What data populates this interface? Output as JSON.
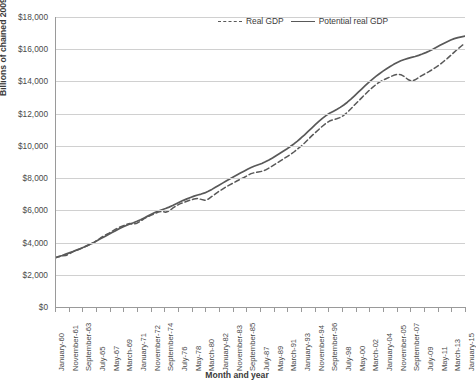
{
  "chart_data": {
    "type": "line",
    "title": "",
    "xlabel": "Month and year",
    "ylabel": "Billions of chained 2009 dollars",
    "ylim": [
      0,
      18000
    ],
    "ytick_labels": [
      "$18,000",
      "$16,000",
      "$14,000",
      "$12,000",
      "$10,000",
      "$8,000",
      "$6,000",
      "$4,000",
      "$2,000",
      "$0"
    ],
    "ytick_values": [
      18000,
      16000,
      14000,
      12000,
      10000,
      8000,
      6000,
      4000,
      2000,
      0
    ],
    "grid": true,
    "legend_position": "top-center",
    "x_tick_labels": [
      "January-60",
      "November-61",
      "September-63",
      "July-65",
      "May-67",
      "March-69",
      "January-71",
      "November-72",
      "September-74",
      "July-76",
      "May-78",
      "March-80",
      "January-82",
      "November-83",
      "September-85",
      "July-87",
      "May-89",
      "March-91",
      "January-93",
      "November-94",
      "September-96",
      "July-98",
      "May-00",
      "March-02",
      "January-04",
      "November-05",
      "September-07",
      "July-09",
      "May-11",
      "March-13",
      "January-15"
    ],
    "series": [
      {
        "name": "Real GDP",
        "style": "dashed",
        "color": "#595959",
        "values": [
          3050,
          3120,
          3180,
          3190,
          3300,
          3420,
          3520,
          3600,
          3690,
          3800,
          3900,
          4010,
          4160,
          4320,
          4450,
          4560,
          4700,
          4830,
          4940,
          5030,
          5120,
          5180,
          5140,
          5200,
          5330,
          5480,
          5600,
          5700,
          5800,
          5890,
          5940,
          5880,
          5960,
          6130,
          6280,
          6400,
          6480,
          6560,
          6640,
          6700,
          6740,
          6680,
          6620,
          6700,
          6860,
          7020,
          7180,
          7320,
          7460,
          7580,
          7700,
          7820,
          7930,
          8040,
          8160,
          8280,
          8340,
          8380,
          8420,
          8500,
          8620,
          8760,
          8900,
          9040,
          9180,
          9320,
          9460,
          9620,
          9800,
          9980,
          10180,
          10400,
          10620,
          10820,
          11020,
          11220,
          11400,
          11540,
          11620,
          11680,
          11760,
          11900,
          12080,
          12300,
          12540,
          12760,
          12980,
          13200,
          13420,
          13620,
          13800,
          13960,
          14080,
          14180,
          14280,
          14380,
          14440,
          14420,
          14300,
          14120,
          14020,
          14100,
          14240,
          14380,
          14500,
          14620,
          14760,
          14900,
          15060,
          15240,
          15420,
          15620,
          15820,
          16020,
          16200,
          16380
        ],
        "start_value": 3050,
        "end_value": 16400,
        "notes": "Fluctuates around potential; sharp drop below potential in 2008-09 recession with persistent gap afterwards"
      },
      {
        "name": "Potential real GDP",
        "style": "solid",
        "color": "#595959",
        "values": [
          3050,
          3130,
          3200,
          3280,
          3360,
          3440,
          3530,
          3620,
          3710,
          3810,
          3910,
          4020,
          4140,
          4260,
          4380,
          4500,
          4620,
          4740,
          4850,
          4960,
          5060,
          5150,
          5230,
          5320,
          5420,
          5530,
          5640,
          5750,
          5860,
          5960,
          6040,
          6110,
          6200,
          6300,
          6410,
          6520,
          6620,
          6710,
          6800,
          6880,
          6950,
          7010,
          7080,
          7180,
          7300,
          7430,
          7560,
          7690,
          7820,
          7950,
          8070,
          8190,
          8310,
          8430,
          8550,
          8660,
          8750,
          8830,
          8910,
          9010,
          9120,
          9250,
          9390,
          9530,
          9670,
          9810,
          9960,
          10120,
          10300,
          10490,
          10690,
          10900,
          11110,
          11320,
          11520,
          11710,
          11880,
          12020,
          12140,
          12260,
          12390,
          12540,
          12710,
          12900,
          13110,
          13320,
          13530,
          13740,
          13940,
          14130,
          14310,
          14480,
          14640,
          14790,
          14930,
          15060,
          15180,
          15280,
          15360,
          15430,
          15490,
          15550,
          15620,
          15700,
          15790,
          15890,
          16000,
          16120,
          16240,
          16360,
          16470,
          16570,
          16660,
          16720,
          16770,
          16810
        ],
        "start_value": 3050,
        "end_value": 16810,
        "notes": "Smooth upward trend line"
      }
    ]
  },
  "legend": {
    "entries": [
      {
        "label": "Real GDP",
        "style": "dashed"
      },
      {
        "label": "Potential real GDP",
        "style": "solid"
      }
    ]
  }
}
